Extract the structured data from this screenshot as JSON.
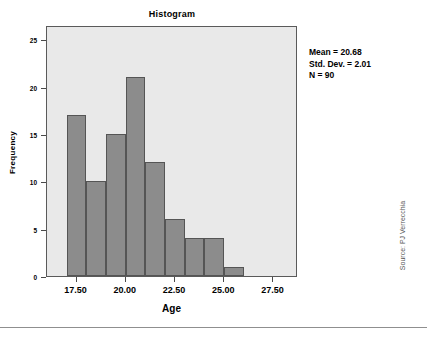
{
  "chart_data": {
    "type": "bar",
    "title": "Histogram",
    "xlabel": "Age",
    "ylabel": "Frequency",
    "categories": [
      "17.0-18.0",
      "18.0-19.0",
      "19.0-20.0",
      "20.0-21.0",
      "21.0-22.0",
      "22.0-23.0",
      "23.0-24.0",
      "24.0-25.0",
      "25.0-26.0"
    ],
    "bin_edges": [
      17.0,
      18.0,
      19.0,
      20.0,
      21.0,
      22.0,
      23.0,
      24.0,
      25.0,
      26.0
    ],
    "values": [
      17,
      10,
      15,
      21,
      12,
      6,
      4,
      4,
      1
    ],
    "bin_width": 1.0,
    "xlim": [
      16.0,
      28.75
    ],
    "ylim": [
      0,
      26.5
    ],
    "x_ticks": [
      17.5,
      20.0,
      22.5,
      25.0,
      27.5
    ],
    "x_tick_labels": [
      "17.50",
      "20.00",
      "22.50",
      "25.00",
      "27.50"
    ],
    "y_ticks": [
      0,
      5,
      10,
      15,
      20,
      25
    ],
    "y_tick_labels": [
      "0",
      "5",
      "10",
      "15",
      "20",
      "25"
    ],
    "grid": false,
    "legend": "none",
    "bar_color": "#8c8c8c",
    "bar_edge_color": "#555555",
    "plot_background": "#e9e9e9",
    "frame_color": "#5a5a5a",
    "annotations": [
      "Mean = 20.68",
      "Std. Dev. = 2.01",
      "N = 90"
    ]
  },
  "stats": {
    "mean_line": "Mean = 20.68",
    "stddev_line": "Std. Dev. = 2.01",
    "n_line": "N = 90"
  },
  "credit": {
    "source_text": "Source: PJ Verrecchia"
  }
}
